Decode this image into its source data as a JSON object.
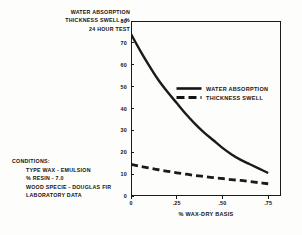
{
  "title": {
    "lines": [
      "WATER ABSORPTION",
      "THICKNESS SWELL - %",
      "24 HOUR TEST"
    ]
  },
  "conditions": {
    "heading": "CONDITIONS:",
    "items": [
      "TYPE WAX - EMULSION",
      "% RESIN - 7.0",
      "WOOD SPECIE - DOUGLAS FIR",
      "LABORATORY DATA"
    ]
  },
  "legend": {
    "items": [
      {
        "label": "WATER ABSORPTION",
        "style": "solid"
      },
      {
        "label": "THICKNESS SWELL",
        "style": "dashed"
      }
    ]
  },
  "axes": {
    "y_ticks": [
      "0",
      "10",
      "20",
      "30",
      "40",
      "50",
      "60",
      "70",
      "80"
    ],
    "x_ticks": [
      "0",
      ".25",
      ".50",
      ".75"
    ],
    "x_title": "% WAX-DRY BASIS",
    "y_title": ""
  },
  "colors": {
    "ink": "#1a1a1a",
    "background": "#fdfdfc"
  },
  "chart_data": {
    "type": "line",
    "title": "WATER ABSORPTION THICKNESS SWELL - % 24 HOUR TEST",
    "xlabel": "% WAX-DRY BASIS",
    "ylabel": "WATER ABSORPTION / THICKNESS SWELL - %",
    "xlim": [
      0,
      0.82
    ],
    "ylim": [
      0,
      80
    ],
    "xticks": [
      0,
      0.25,
      0.5,
      0.75
    ],
    "xticklabels": [
      "0",
      ".25",
      ".50",
      ".75"
    ],
    "yticks": [
      0,
      10,
      20,
      30,
      40,
      50,
      60,
      70,
      80
    ],
    "grid": false,
    "legend_position": "center-right-upper",
    "series": [
      {
        "name": "WATER ABSORPTION",
        "style": "solid",
        "x": [
          0.0,
          0.05,
          0.1,
          0.15,
          0.2,
          0.25,
          0.3,
          0.35,
          0.4,
          0.45,
          0.5,
          0.55,
          0.6,
          0.65,
          0.7,
          0.75
        ],
        "y": [
          74.0,
          66.5,
          59.5,
          53.0,
          47.5,
          42.5,
          37.5,
          33.0,
          29.0,
          25.5,
          22.0,
          19.0,
          16.5,
          14.5,
          12.5,
          10.5
        ]
      },
      {
        "name": "THICKNESS SWELL",
        "style": "dashed",
        "x": [
          0.0,
          0.05,
          0.1,
          0.15,
          0.2,
          0.25,
          0.3,
          0.35,
          0.4,
          0.45,
          0.5,
          0.55,
          0.6,
          0.65,
          0.7,
          0.75
        ],
        "y": [
          14.5,
          13.6,
          12.8,
          12.0,
          11.3,
          10.6,
          10.0,
          9.4,
          8.9,
          8.4,
          8.0,
          7.5,
          7.1,
          6.6,
          6.1,
          5.6
        ]
      }
    ]
  }
}
